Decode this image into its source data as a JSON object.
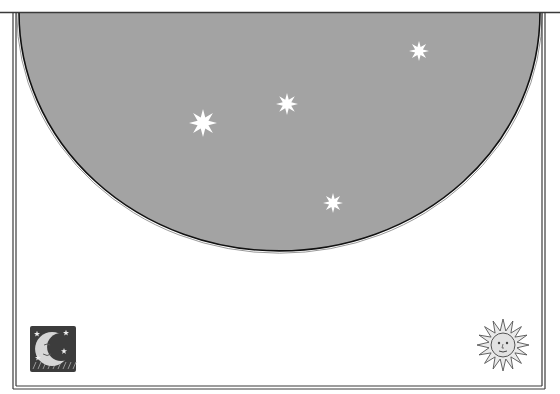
{
  "scene": {
    "width": 560,
    "height": 394,
    "background": "#ffffff",
    "frame": {
      "top_line_y": 12.5,
      "left_x": 13,
      "right_x": 545,
      "bottom_y": 389,
      "line_color": "#3a3a3a",
      "double_gap": 3
    },
    "sky": {
      "fill": "#a3a3a3",
      "outline_color": "#111111",
      "outline_inner_color": "#8c8c8c",
      "left_x": 19,
      "right_x": 540,
      "top_y": 13,
      "bottom_y": 251
    },
    "stars": [
      {
        "name": "star-large",
        "x": 203,
        "y": 123,
        "r": 14
      },
      {
        "name": "star-medium",
        "x": 287,
        "y": 104,
        "r": 11
      },
      {
        "name": "star-upper-right",
        "x": 419,
        "y": 51,
        "r": 10
      },
      {
        "name": "star-lower",
        "x": 333,
        "y": 203,
        "r": 10
      }
    ],
    "star_color": "#ffffff",
    "ornaments": {
      "moon": {
        "label": "crescent-moon-woodcut",
        "x": 30,
        "y": 326,
        "size": 46
      },
      "sun": {
        "label": "sun-face-woodcut",
        "cx": 503,
        "cy": 345,
        "r": 26
      }
    }
  }
}
